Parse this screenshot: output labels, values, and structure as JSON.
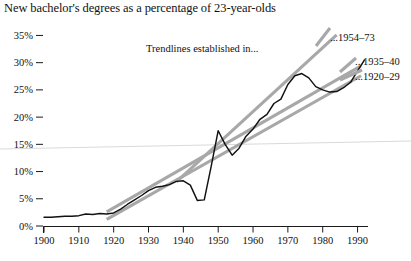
{
  "chart_data": {
    "type": "line",
    "title": "New bachelor's degrees as a percentage of 23-year-olds",
    "xlabel": "",
    "ylabel": "",
    "xlim": [
      1900,
      1993
    ],
    "ylim": [
      0,
      36
    ],
    "grid": false,
    "legend_position": "right-inside",
    "y_ticks": [
      0,
      5,
      10,
      15,
      20,
      25,
      30,
      35
    ],
    "y_tick_labels": [
      "0%",
      "5%",
      "10%",
      "15%",
      "20%",
      "25%",
      "30%",
      "35%"
    ],
    "x_ticks": [
      1900,
      1910,
      1920,
      1930,
      1940,
      1950,
      1960,
      1970,
      1980,
      1990
    ],
    "x_tick_labels": [
      "1900",
      "1910",
      "1920",
      "1930",
      "1940",
      "1950",
      "1960",
      "1970",
      "1980",
      "1990"
    ],
    "annotation": "Trendlines established in...",
    "series": [
      {
        "name": "New bachelor's degrees as a percentage of 23-year-olds",
        "color": "#111111",
        "x": [
          1900,
          1902,
          1904,
          1906,
          1908,
          1910,
          1912,
          1914,
          1916,
          1918,
          1920,
          1922,
          1924,
          1926,
          1928,
          1930,
          1932,
          1934,
          1936,
          1938,
          1940,
          1942,
          1944,
          1946,
          1948,
          1950,
          1952,
          1954,
          1956,
          1958,
          1960,
          1962,
          1964,
          1966,
          1968,
          1970,
          1972,
          1974,
          1976,
          1978,
          1980,
          1982,
          1984,
          1986,
          1988,
          1990,
          1992
        ],
        "y": [
          1.6,
          1.6,
          1.7,
          1.8,
          1.8,
          1.9,
          2.2,
          2.1,
          2.3,
          2.2,
          2.4,
          3.1,
          4.0,
          4.8,
          5.6,
          6.5,
          7.1,
          7.3,
          7.6,
          8.2,
          8.3,
          7.5,
          4.7,
          4.8,
          11.0,
          17.5,
          15.0,
          13.0,
          14.3,
          16.5,
          17.8,
          19.6,
          20.5,
          22.5,
          23.3,
          26.0,
          27.6,
          28.0,
          27.2,
          25.6,
          25.0,
          24.6,
          24.7,
          25.4,
          26.4,
          28.5,
          30.5
        ]
      }
    ],
    "trendlines": [
      {
        "name": "...1920–29",
        "label": "...1920–29",
        "color": "#a8a8a8",
        "x0": 1918,
        "y0": 1.2,
        "x1": 1991,
        "y1": 27.6
      },
      {
        "name": "...1935–40",
        "label": "...1935–40",
        "color": "#a8a8a8",
        "x0": 1918,
        "y0": 2.6,
        "x1": 1991,
        "y1": 29.4
      },
      {
        "name": "...1954–73",
        "label": "...1954–73",
        "color": "#a8a8a8",
        "x0": 1938,
        "y0": 8.1,
        "x1": 1984,
        "y1": 35.1
      }
    ]
  },
  "legend": {
    "items": [
      {
        "label": "...1954–73"
      },
      {
        "label": "...1935–40"
      },
      {
        "label": "...1920–29"
      }
    ]
  }
}
